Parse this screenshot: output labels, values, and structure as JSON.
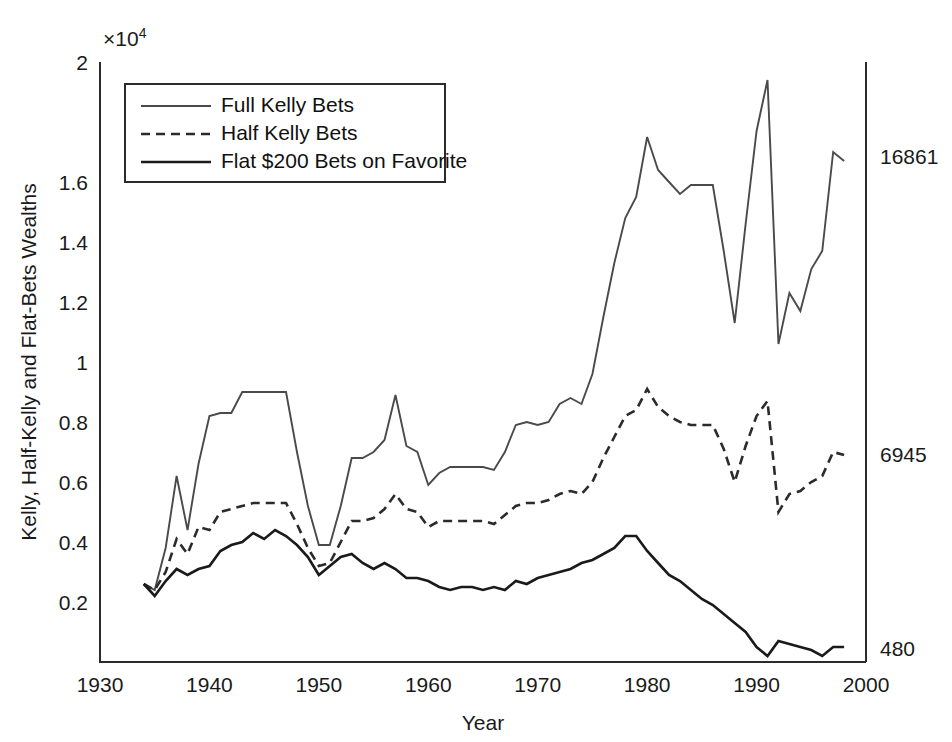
{
  "figure": {
    "background": "#ffffff",
    "axis_color": "#2b2b2b",
    "exponent_label": "×10",
    "exponent_sup": "4"
  },
  "axes": {
    "ylabel": "Kelly, Half-Kelly and Flat-Bets Wealths",
    "xlabel": "Year",
    "x_ticks": [
      "1930",
      "1940",
      "1950",
      "1960",
      "1970",
      "1980",
      "1990",
      "2000"
    ],
    "y_ticks": [
      "0.2",
      "0.4",
      "0.6",
      "0.8",
      "1",
      "1.2",
      "1.4",
      "1.6",
      "2"
    ],
    "right_labels": [
      {
        "text": "16861",
        "value": 1.6861
      },
      {
        "text": "6945",
        "value": 0.6945
      },
      {
        "text": "480",
        "value": 0.048
      }
    ]
  },
  "legend": {
    "items": [
      {
        "label": "Full Kelly Bets",
        "style": "solid",
        "color": "#4a4a4a",
        "width": 1.8
      },
      {
        "label": "Half Kelly Bets",
        "style": "dashed",
        "color": "#2b2b2b",
        "width": 2.6
      },
      {
        "label": "Flat $200 Bets on Favorite",
        "style": "solid",
        "color": "#1a1a1a",
        "width": 2.6
      }
    ]
  },
  "chart_data": {
    "type": "line",
    "title": "",
    "xlabel": "Year",
    "ylabel": "Kelly, Half-Kelly and Flat-Bets Wealths",
    "y_scale_multiplier": 10000,
    "xlim": [
      1930,
      2000
    ],
    "ylim": [
      0,
      2
    ],
    "grid": false,
    "legend_position": "upper-left",
    "x": [
      1934,
      1935,
      1936,
      1937,
      1938,
      1939,
      1940,
      1941,
      1942,
      1943,
      1944,
      1945,
      1946,
      1947,
      1948,
      1949,
      1950,
      1951,
      1952,
      1953,
      1954,
      1955,
      1956,
      1957,
      1958,
      1959,
      1960,
      1961,
      1962,
      1963,
      1964,
      1965,
      1966,
      1967,
      1968,
      1969,
      1970,
      1971,
      1972,
      1973,
      1974,
      1975,
      1976,
      1977,
      1978,
      1979,
      1980,
      1981,
      1982,
      1983,
      1984,
      1985,
      1986,
      1987,
      1988,
      1989,
      1990,
      1991,
      1992,
      1993,
      1994,
      1995,
      1996,
      1997,
      1998
    ],
    "series": [
      {
        "name": "Full Kelly Bets",
        "style": "solid",
        "color": "#4a4a4a",
        "values": [
          0.26,
          0.24,
          0.38,
          0.62,
          0.44,
          0.66,
          0.82,
          0.83,
          0.83,
          0.9,
          0.9,
          0.9,
          0.9,
          0.9,
          0.7,
          0.52,
          0.39,
          0.39,
          0.52,
          0.68,
          0.68,
          0.7,
          0.74,
          0.89,
          0.72,
          0.7,
          0.59,
          0.63,
          0.65,
          0.65,
          0.65,
          0.65,
          0.64,
          0.7,
          0.79,
          0.8,
          0.79,
          0.8,
          0.86,
          0.88,
          0.86,
          0.96,
          1.15,
          1.33,
          1.48,
          1.55,
          1.75,
          1.64,
          1.6,
          1.56,
          1.59,
          1.59,
          1.59,
          1.37,
          1.13,
          1.46,
          1.77,
          1.94,
          1.06,
          1.23,
          1.17,
          1.31,
          1.37,
          1.7,
          1.67
        ]
      },
      {
        "name": "Half Kelly Bets",
        "style": "dashed",
        "color": "#2b2b2b",
        "values": [
          0.26,
          0.24,
          0.3,
          0.41,
          0.36,
          0.45,
          0.44,
          0.5,
          0.51,
          0.52,
          0.53,
          0.53,
          0.53,
          0.53,
          0.46,
          0.38,
          0.32,
          0.33,
          0.4,
          0.47,
          0.47,
          0.48,
          0.51,
          0.56,
          0.51,
          0.5,
          0.45,
          0.47,
          0.47,
          0.47,
          0.47,
          0.47,
          0.46,
          0.49,
          0.52,
          0.53,
          0.53,
          0.54,
          0.56,
          0.57,
          0.56,
          0.6,
          0.68,
          0.75,
          0.82,
          0.84,
          0.91,
          0.85,
          0.82,
          0.8,
          0.79,
          0.79,
          0.79,
          0.71,
          0.6,
          0.72,
          0.82,
          0.87,
          0.5,
          0.56,
          0.57,
          0.6,
          0.62,
          0.7,
          0.69
        ]
      },
      {
        "name": "Flat $200 Bets on Favorite",
        "style": "solid",
        "color": "#1a1a1a",
        "values": [
          0.26,
          0.22,
          0.27,
          0.31,
          0.29,
          0.31,
          0.32,
          0.37,
          0.39,
          0.4,
          0.43,
          0.41,
          0.44,
          0.42,
          0.39,
          0.35,
          0.29,
          0.32,
          0.35,
          0.36,
          0.33,
          0.31,
          0.33,
          0.31,
          0.28,
          0.28,
          0.27,
          0.25,
          0.24,
          0.25,
          0.25,
          0.24,
          0.25,
          0.24,
          0.27,
          0.26,
          0.28,
          0.29,
          0.3,
          0.31,
          0.33,
          0.34,
          0.36,
          0.38,
          0.42,
          0.42,
          0.37,
          0.33,
          0.29,
          0.27,
          0.24,
          0.21,
          0.19,
          0.16,
          0.13,
          0.1,
          0.05,
          0.02,
          0.07,
          0.06,
          0.05,
          0.04,
          0.02,
          0.05,
          0.05
        ]
      }
    ]
  }
}
